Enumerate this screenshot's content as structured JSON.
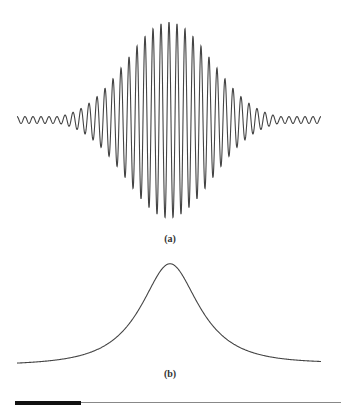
{
  "figure": {
    "panels": [
      {
        "id": "a",
        "label": "(a)",
        "description": "Gaussian-modulated oscillating wave packet"
      },
      {
        "id": "b",
        "label": "(b)",
        "description": "Bell-shaped (Lorentzian-like) envelope"
      }
    ],
    "line_color": "#444444",
    "rule_color": "#888888",
    "rule_accent_color": "#111111"
  },
  "chart_data": [
    {
      "type": "line",
      "title": "(a)",
      "xlabel": "",
      "ylabel": "",
      "grid": false,
      "description": "Cosine carrier with Gaussian envelope",
      "x_range": [
        -1,
        1
      ],
      "carrier_cycles": 38,
      "peak_amplitude": 1.0,
      "envelope_width_sigma": 0.28,
      "center": 0
    },
    {
      "type": "line",
      "title": "(b)",
      "xlabel": "",
      "ylabel": "",
      "grid": false,
      "description": "Single symmetric peak with slowly decaying tails",
      "x_range": [
        -1,
        1
      ],
      "peak_amplitude": 1.0,
      "half_width": 0.2,
      "center": 0
    }
  ]
}
